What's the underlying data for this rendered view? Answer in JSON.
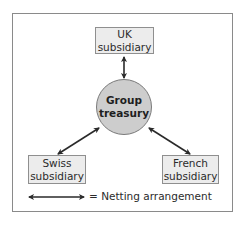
{
  "diagram": {
    "center_node": {
      "label_line1": "Group",
      "label_line2": "treasury",
      "fill": "#cdcdcd"
    },
    "nodes": [
      {
        "id": "uk",
        "label_line1": "UK",
        "label_line2": "subsidiary"
      },
      {
        "id": "swiss",
        "label_line1": "Swiss",
        "label_line2": "subsidiary"
      },
      {
        "id": "french",
        "label_line1": "French",
        "label_line2": "subsidiary"
      }
    ],
    "connections": [
      {
        "from": "uk",
        "to": "group-treasury",
        "type": "netting",
        "bidirectional": true
      },
      {
        "from": "swiss",
        "to": "group-treasury",
        "type": "netting",
        "bidirectional": true
      },
      {
        "from": "french",
        "to": "group-treasury",
        "type": "netting",
        "bidirectional": true
      }
    ],
    "legend": {
      "symbol": "double-headed-arrow",
      "label": "= Netting arrangement"
    },
    "colors": {
      "box_fill": "#ececec",
      "box_border": "#8f8f8f",
      "arrow": "#2a2a2a",
      "frame_border": "#8a8a8a"
    }
  }
}
